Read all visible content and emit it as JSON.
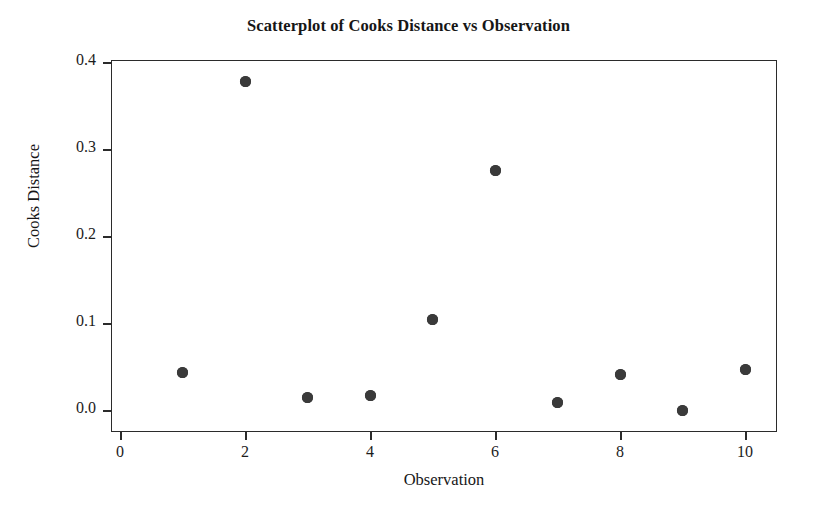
{
  "chart_data": {
    "type": "scatter",
    "title": "Scatterplot of Cooks Distance vs Observation",
    "xlabel": "Observation",
    "ylabel": "Cooks Distance",
    "x": [
      1,
      2,
      3,
      4,
      5,
      6,
      7,
      8,
      9,
      10
    ],
    "values": [
      0.043,
      0.378,
      0.014,
      0.017,
      0.104,
      0.275,
      0.009,
      0.041,
      -0.001,
      0.046
    ],
    "series": [
      {
        "name": "Cooks Distance",
        "values": [
          0.043,
          0.378,
          0.014,
          0.017,
          0.104,
          0.275,
          0.009,
          0.041,
          -0.001,
          0.046
        ]
      }
    ],
    "xlim": [
      0,
      10.6
    ],
    "ylim": [
      -0.0163,
      0.4
    ],
    "xticks": [
      0,
      2,
      4,
      6,
      8,
      10
    ],
    "xtick_labels": [
      "0",
      "2",
      "4",
      "6",
      "8",
      "10"
    ],
    "yticks": [
      0.0,
      0.1,
      0.2,
      0.3,
      0.4
    ],
    "ytick_labels": [
      "0.0",
      "0.1",
      "0.2",
      "0.3",
      "0.4"
    ],
    "grid": false,
    "legend": false,
    "marker": "filled-circle",
    "marker_color": "#3a3a3a",
    "frame_color": "#2b2b2b",
    "background": "#ffffff"
  }
}
